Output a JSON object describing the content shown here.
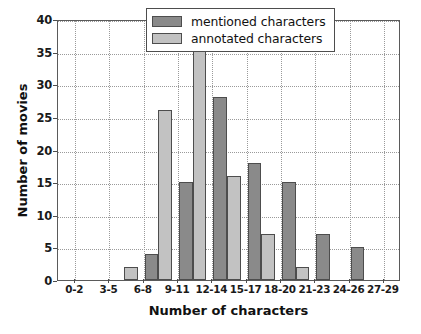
{
  "chart_data": {
    "type": "bar",
    "title": "",
    "xlabel": "Number of characters",
    "ylabel": "Number of movies",
    "categories": [
      "0-2",
      "3-5",
      "6-8",
      "9-11",
      "12-14",
      "15-17",
      "18-20",
      "21-23",
      "24-26",
      "27-29"
    ],
    "series": [
      {
        "name": "mentioned characters",
        "color": "#8a8a8a",
        "values": [
          0,
          0,
          4,
          15,
          28,
          18,
          15,
          7,
          5,
          0
        ]
      },
      {
        "name": "annotated characters",
        "color": "#c2c2c2",
        "values": [
          0,
          2,
          26,
          39,
          16,
          7,
          2,
          0,
          0,
          0
        ]
      }
    ],
    "ylim": [
      0,
      40
    ],
    "yticks": [
      0,
      5,
      10,
      15,
      20,
      25,
      30,
      35,
      40
    ],
    "ytick_labels": [
      "0",
      "5",
      "10",
      "15",
      "20",
      "25",
      "30",
      "35",
      "40"
    ],
    "grid": true,
    "grid_style": "dotted",
    "legend_position": "top-right"
  },
  "legend": {
    "items": [
      {
        "label": "mentioned characters",
        "swatch": "mentioned"
      },
      {
        "label": "annotated characters",
        "swatch": "annotated"
      }
    ]
  },
  "axes": {
    "x_title": "Number of characters",
    "y_title": "Number of movies"
  }
}
